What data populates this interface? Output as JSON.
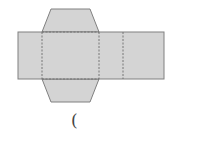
{
  "diagram": {
    "title": "",
    "colors": {
      "fill": "#d4d4d4",
      "edge": "#808080",
      "fold": "#6e6e6e",
      "background": "#ffffff"
    },
    "shapes": {
      "main_strip": {
        "x": 18,
        "y": 32,
        "width": 146,
        "height": 47
      },
      "top_flap": {
        "points": "51,9 90,9 99,32 42,32"
      },
      "bottom_flap": {
        "points": "42,79 99,79 90,102 51,102"
      }
    },
    "fold_lines": [
      {
        "x1": 42,
        "y1": 32,
        "x2": 42,
        "y2": 79
      },
      {
        "x1": 99,
        "y1": 32,
        "x2": 99,
        "y2": 79
      },
      {
        "x1": 123,
        "y1": 32,
        "x2": 123,
        "y2": 79
      },
      {
        "x1": 42,
        "y1": 32,
        "x2": 99,
        "y2": 32
      },
      {
        "x1": 42,
        "y1": 79,
        "x2": 99,
        "y2": 79
      }
    ]
  },
  "answer_blank": {
    "open_paren": "("
  }
}
